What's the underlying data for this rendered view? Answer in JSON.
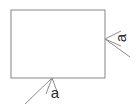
{
  "figure": {
    "canvas": {
      "width": 137,
      "height": 108,
      "background": "#ffffff"
    },
    "style": {
      "outline_color": "#9a9a9a",
      "outline_width": 1.2,
      "leader_color": "#8d8d8d",
      "leader_width": 1.0,
      "label_color": "#2b2b2b",
      "label_font_size": 15
    },
    "shape": {
      "kind": "rectangle",
      "name": "square",
      "x": 11,
      "y": 10,
      "width": 94,
      "height": 68
    },
    "dimensions": [
      {
        "id": "bottom-side",
        "label": "a",
        "label_x": 55,
        "label_y": 94,
        "label_rotation": 0,
        "arrow_tip_x": 52,
        "arrow_tip_y": 78,
        "leader_end_x": 25,
        "leader_end_y": 104,
        "arrow_wing_left_x": 46,
        "arrow_wing_left_y": 94,
        "arrow_wing_right_x": 58,
        "arrow_wing_right_y": 94
      },
      {
        "id": "right-side",
        "label": "a",
        "label_x": 122,
        "label_y": 38,
        "label_rotation": -90,
        "arrow_tip_x": 105,
        "arrow_tip_y": 39,
        "leader_end_x": 130,
        "leader_end_y": 57,
        "arrow_wing_top_x": 121,
        "arrow_wing_top_y": 31,
        "arrow_wing_bottom_x": 121,
        "arrow_wing_bottom_y": 46
      }
    ]
  }
}
